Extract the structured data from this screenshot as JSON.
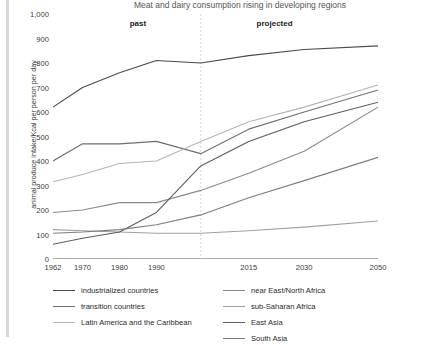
{
  "chart_data": {
    "type": "line",
    "title": "Meat and dairy consumption rising in developing regions",
    "xlabel": "",
    "ylabel": "animal produce intake/Kcal per person per day",
    "xlim": [
      1962,
      2050
    ],
    "ylim": [
      0,
      1000
    ],
    "xticks": [
      1962,
      1970,
      1980,
      1990,
      2002,
      2015,
      2030,
      2050
    ],
    "xtick_labels": [
      "1962",
      "1970",
      "1980",
      "1990",
      "",
      "2015",
      "2030",
      "2050"
    ],
    "yticks": [
      0,
      100,
      200,
      300,
      400,
      500,
      600,
      700,
      800,
      900,
      1000
    ],
    "ytick_labels": [
      "0",
      "100",
      "200",
      "300",
      "400",
      "500",
      "600",
      "700",
      "800",
      "900",
      "1,000"
    ],
    "grid": false,
    "legend_position": "bottom",
    "annotations": [
      {
        "text": "past",
        "x": 1985,
        "y": 960
      },
      {
        "text": "projected",
        "x": 2022,
        "y": 960
      }
    ],
    "divider_x": 2002,
    "x": [
      1962,
      1970,
      1980,
      1990,
      2002,
      2015,
      2030,
      2050
    ],
    "series": [
      {
        "name": "industrialized countries",
        "color": "#4a4a4a",
        "values": [
          620,
          700,
          760,
          810,
          800,
          830,
          855,
          870
        ]
      },
      {
        "name": "transition countries",
        "color": "#6f6f6f",
        "values": [
          400,
          470,
          470,
          480,
          430,
          530,
          600,
          690
        ]
      },
      {
        "name": "Latin America and the Caribbean",
        "color": "#b4b4b4",
        "values": [
          315,
          345,
          390,
          400,
          480,
          560,
          620,
          710
        ]
      },
      {
        "name": "near East/North Africa",
        "color": "#8a8a8a",
        "values": [
          190,
          200,
          230,
          230,
          280,
          350,
          440,
          620
        ]
      },
      {
        "name": "sub-Saharan Africa",
        "color": "#a0a0a0",
        "values": [
          120,
          115,
          110,
          105,
          105,
          115,
          130,
          155
        ]
      },
      {
        "name": "East Asia",
        "color": "#5c5c5c",
        "values": [
          60,
          85,
          110,
          190,
          380,
          480,
          560,
          640
        ]
      },
      {
        "name": "South Asia",
        "color": "#7d7d7d",
        "values": [
          105,
          110,
          120,
          140,
          180,
          250,
          320,
          415
        ]
      }
    ]
  },
  "legend": {
    "col1": [
      {
        "label": "industrialized countries",
        "color": "#4a4a4a"
      },
      {
        "label": "transition countries",
        "color": "#6f6f6f"
      },
      {
        "label": "Latin America and the Caribbean",
        "color": "#b4b4b4"
      }
    ],
    "col2": [
      {
        "label": "near East/North Africa",
        "color": "#8a8a8a"
      },
      {
        "label": "sub-Saharan Africa",
        "color": "#a0a0a0"
      },
      {
        "label": "East Asia",
        "color": "#5c5c5c"
      },
      {
        "label": "South Asia",
        "color": "#7d7d7d"
      }
    ]
  }
}
